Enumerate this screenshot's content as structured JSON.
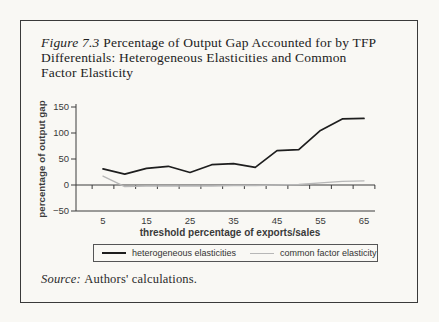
{
  "page": {
    "background": "#f9f8f4"
  },
  "figure": {
    "label": "Figure 7.3",
    "title_line1": "Percentage of Output Gap Accounted for by TFP",
    "title_line2": "Differentials: Heterogeneous Elasticities and Common",
    "title_line3": "Factor Elasticity",
    "source_label": "Source:",
    "source_text": "Authors' calculations."
  },
  "chart_data": {
    "type": "line",
    "title": "",
    "xlabel": "threshold percentage of exports/sales",
    "ylabel": "percentage of output gap",
    "x": [
      5,
      10,
      15,
      20,
      25,
      30,
      35,
      40,
      45,
      50,
      55,
      60,
      65
    ],
    "xtick_labels": [
      "5",
      "15",
      "25",
      "35",
      "45",
      "55",
      "65"
    ],
    "yticks": [
      {
        "v": 150,
        "label": "150"
      },
      {
        "v": 100,
        "label": "100"
      },
      {
        "v": 50,
        "label": "50"
      },
      {
        "v": 0,
        "label": "0"
      },
      {
        "v": -50,
        "label": "−50"
      }
    ],
    "ylim": [
      -50,
      150
    ],
    "grid": false,
    "legend_position": "bottom",
    "axis_color": "#3c3c3c",
    "series": [
      {
        "name": "heterogeneous elasticities",
        "color": "#1e1e1e",
        "values": [
          31,
          21,
          32,
          36,
          24,
          39,
          41,
          34,
          66,
          68,
          105,
          127,
          128
        ]
      },
      {
        "name": "common factor elasticity",
        "color": "#b7b7b7",
        "values": [
          17,
          -3,
          -2,
          -2,
          -2,
          -2,
          -1,
          -1,
          0,
          1,
          4,
          7,
          8
        ]
      }
    ]
  }
}
